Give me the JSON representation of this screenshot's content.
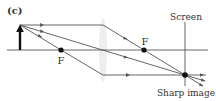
{
  "figure": {
    "panel_label": "(c)",
    "labels": {
      "focal_left": "F",
      "focal_right": "F",
      "screen": "Screen",
      "image": "Sharp image"
    },
    "colors": {
      "line": "#555555",
      "object": "#111111",
      "lens": "#eeeeee",
      "point": "#111111"
    },
    "elements": {
      "optical_axis": {
        "x1": 7,
        "x2": 208,
        "y": 50
      },
      "object_arrow": {
        "x": 20,
        "y_base": 50,
        "y_tip": 25
      },
      "lens": {
        "cx": 103,
        "cy": 50,
        "rx": 4,
        "ry": 32
      },
      "focal_points": [
        {
          "x": 61,
          "y": 50
        },
        {
          "x": 144,
          "y": 50
        }
      ],
      "screen": {
        "x": 185,
        "y1": 22,
        "y2": 86
      },
      "image_point": {
        "x": 185,
        "y": 75
      }
    },
    "rays": [
      {
        "name": "parallel-ray",
        "points": [
          [
            20,
            25
          ],
          [
            103,
            25
          ],
          [
            185,
            75
          ],
          [
            203,
            86
          ]
        ]
      },
      {
        "name": "center-ray",
        "points": [
          [
            20,
            25
          ],
          [
            185,
            75
          ],
          [
            205,
            81
          ]
        ]
      },
      {
        "name": "focal-ray",
        "points": [
          [
            20,
            25
          ],
          [
            61,
            50
          ],
          [
            103,
            75
          ],
          [
            185,
            75
          ],
          [
            206,
            75
          ]
        ]
      }
    ]
  }
}
